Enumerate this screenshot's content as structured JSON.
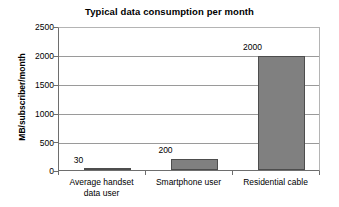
{
  "chart_data": {
    "type": "bar",
    "title": "Typical data consumption per month",
    "xlabel": "",
    "ylabel": "MB/subscriber/month",
    "categories": [
      "Average handset data user",
      "Smartphone user",
      "Residential cable"
    ],
    "category_lines": [
      [
        "Average handset",
        "data user"
      ],
      [
        "Smartphone user"
      ],
      [
        "Residential cable"
      ]
    ],
    "values": [
      30,
      200,
      2000
    ],
    "value_labels": [
      "30",
      "200",
      "2000"
    ],
    "ylim": [
      0,
      2500
    ],
    "yticks": [
      0,
      500,
      1000,
      1500,
      2000,
      2500
    ],
    "ytick_labels": [
      "0",
      "500",
      "1000",
      "1500",
      "2000",
      "2500"
    ],
    "grid": "horizontal",
    "legend": "none",
    "bar_color": "#808080",
    "bar_border_color": "#4d4d4d",
    "gridline_color": "#9a9a9a",
    "axis_color": "#6e6e6e",
    "background_color": "#ffffff"
  }
}
